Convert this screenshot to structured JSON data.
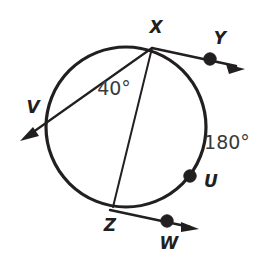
{
  "figure": {
    "kind": "circle-geometry-diagram",
    "background_color": "#ffffff",
    "ink_color": "#221f20",
    "label_color": "#3a3a3c",
    "circle": {
      "center_x": 126,
      "center_y": 127,
      "radius": 80,
      "stroke_width": 3.2
    },
    "points": [
      {
        "id": "X",
        "label": "X",
        "cx": 152,
        "cy": 48,
        "label_x": 156,
        "label_y": 28,
        "has_dot": false,
        "on_circle": true
      },
      {
        "id": "Y",
        "label": "Y",
        "cx": 210,
        "cy": 59,
        "label_x": 220,
        "label_y": 39,
        "has_dot": true,
        "on_circle": false
      },
      {
        "id": "V",
        "label": "V",
        "cx": 48,
        "cy": 121,
        "label_x": 33,
        "label_y": 108,
        "has_dot": false,
        "on_circle": true
      },
      {
        "id": "U",
        "label": "U",
        "cx": 190,
        "cy": 176,
        "label_x": 211,
        "label_y": 182,
        "has_dot": true,
        "on_circle": true
      },
      {
        "id": "Z",
        "label": "Z",
        "cx": 113,
        "cy": 207,
        "label_x": 110,
        "label_y": 226,
        "has_dot": false,
        "on_circle": true
      },
      {
        "id": "W",
        "label": "W",
        "cx": 167,
        "cy": 221,
        "label_x": 169,
        "label_y": 244,
        "has_dot": true,
        "on_circle": false
      }
    ],
    "segments": [
      {
        "id": "ray-x-to-y",
        "from": "X",
        "to": "Y",
        "x1": 152,
        "y1": 48,
        "x2": 243,
        "y2": 68,
        "arrow_at_end": true,
        "stroke_width": 2.6
      },
      {
        "id": "ray-x-to-v",
        "from": "X",
        "to": "V",
        "x1": 152,
        "y1": 48,
        "x2": 22,
        "y2": 139,
        "arrow_at_end": true,
        "stroke_width": 2.2
      },
      {
        "id": "chord-x-to-z",
        "from": "X",
        "to": "Z",
        "x1": 152,
        "y1": 48,
        "x2": 113,
        "y2": 207,
        "arrow_at_end": false,
        "stroke_width": 2.0
      },
      {
        "id": "ray-z-to-w",
        "from": "Z",
        "to": "W",
        "x1": 110,
        "y1": 210,
        "x2": 198,
        "y2": 229,
        "arrow_at_end": true,
        "stroke_width": 2.4
      }
    ],
    "measure_labels": [
      {
        "id": "angle-40",
        "text": "40°",
        "x": 114,
        "y": 89,
        "describes": "arc-XV"
      },
      {
        "id": "arc-180",
        "text": "180°",
        "x": 227,
        "y": 143,
        "describes": "arc-XU"
      }
    ]
  }
}
